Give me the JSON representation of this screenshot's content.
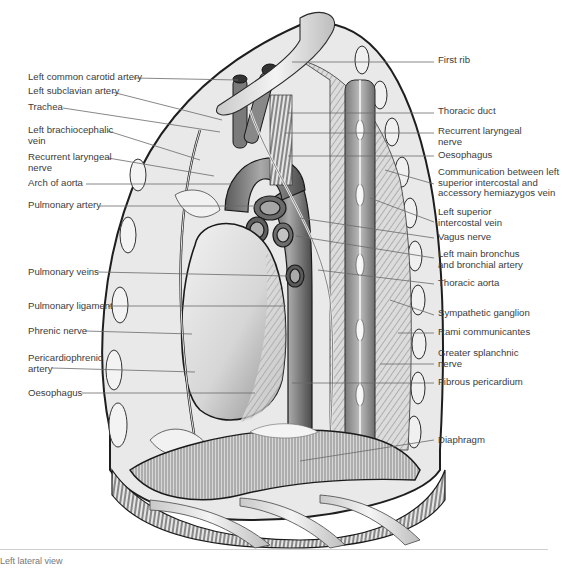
{
  "figure": {
    "labels_left": [
      {
        "text": "Left common carotid artery",
        "x": 28,
        "y": 72
      },
      {
        "text": "Left subclavian artery",
        "x": 28,
        "y": 86
      },
      {
        "text": "Trachea",
        "x": 28,
        "y": 102
      },
      {
        "text": "Left brachiocephalic\nvein",
        "x": 28,
        "y": 125
      },
      {
        "text": "Recurrent laryngeal\nnerve",
        "x": 28,
        "y": 152
      },
      {
        "text": "Arch of aorta",
        "x": 28,
        "y": 178
      },
      {
        "text": "Pulmonary artery",
        "x": 28,
        "y": 200
      },
      {
        "text": "Pulmonary veins",
        "x": 28,
        "y": 267
      },
      {
        "text": "Pulmonary ligament",
        "x": 28,
        "y": 301
      },
      {
        "text": "Phrenic nerve",
        "x": 28,
        "y": 326
      },
      {
        "text": "Pericardiophrenic\nartery",
        "x": 28,
        "y": 353
      },
      {
        "text": "Oesophagus",
        "x": 28,
        "y": 388
      }
    ],
    "labels_right": [
      {
        "text": "First rib",
        "x": 438,
        "y": 55
      },
      {
        "text": "Thoracic duct",
        "x": 438,
        "y": 106
      },
      {
        "text": "Recurrent laryngeal\nnerve",
        "x": 438,
        "y": 126
      },
      {
        "text": "Oesophagus",
        "x": 438,
        "y": 150
      },
      {
        "text": "Communication between left\nsuperior intercostal and\naccessory hemiazygos vein",
        "x": 438,
        "y": 167
      },
      {
        "text": "Left superior\nintercostal vein",
        "x": 438,
        "y": 207
      },
      {
        "text": "Vagus nerve",
        "x": 438,
        "y": 232
      },
      {
        "text": "Left main bronchus\nand bronchial artery",
        "x": 438,
        "y": 249
      },
      {
        "text": "Thoracic aorta",
        "x": 438,
        "y": 278
      },
      {
        "text": "Sympathetic ganglion",
        "x": 438,
        "y": 308
      },
      {
        "text": "Rami communicantes",
        "x": 438,
        "y": 327
      },
      {
        "text": "Greater splanchnic\nnerve",
        "x": 438,
        "y": 348
      },
      {
        "text": "Fibrous pericardium",
        "x": 438,
        "y": 377
      },
      {
        "text": "Diaphragm",
        "x": 438,
        "y": 435
      }
    ],
    "caption": "Left lateral view"
  }
}
